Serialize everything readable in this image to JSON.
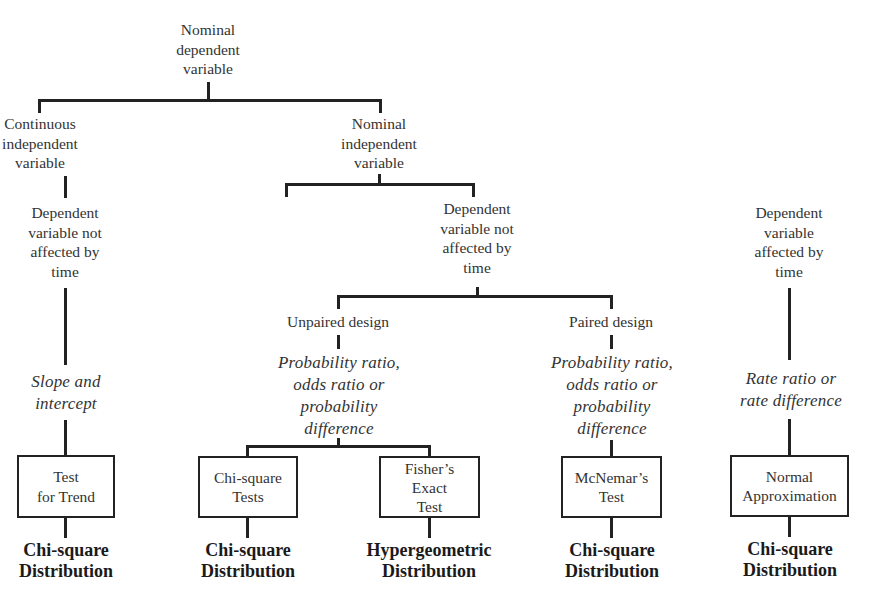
{
  "diagram": {
    "root": {
      "lines": [
        "Nominal",
        "dependent",
        "variable"
      ]
    },
    "left_branch": {
      "independent": {
        "lines": [
          "Continuous",
          "independent",
          "variable"
        ]
      },
      "dependent_time": {
        "lines": [
          "Dependent",
          "variable not",
          "affected by",
          "time"
        ]
      },
      "measure": {
        "lines": [
          "Slope and",
          "intercept"
        ]
      },
      "test": {
        "lines": [
          "Test",
          "for Trend"
        ]
      },
      "distribution": {
        "lines": [
          "Chi-square",
          "Distribution"
        ]
      }
    },
    "right_branch": {
      "independent": {
        "lines": [
          "Nominal",
          "independent",
          "variable"
        ]
      },
      "not_affected": {
        "label": {
          "lines": [
            "Dependent",
            "variable not",
            "affected by",
            "time"
          ]
        },
        "unpaired": {
          "design": "Unpaired design",
          "measure": {
            "lines": [
              "Probability ratio,",
              "odds ratio or",
              "probability",
              "difference"
            ]
          },
          "tests": [
            {
              "lines": [
                "Chi-square",
                "Tests"
              ],
              "distribution": [
                "Chi-square",
                "Distribution"
              ]
            },
            {
              "lines": [
                "Fisher’s",
                "Exact",
                "Test"
              ],
              "distribution": [
                "Hypergeometric",
                "Distribution"
              ]
            }
          ]
        },
        "paired": {
          "design": "Paired design",
          "measure": {
            "lines": [
              "Probability ratio,",
              "odds ratio or",
              "probability",
              "difference"
            ]
          },
          "test": {
            "lines": [
              "McNemar’s",
              "Test"
            ]
          },
          "distribution": {
            "lines": [
              "Chi-square",
              "Distribution"
            ]
          }
        }
      },
      "affected": {
        "label": {
          "lines": [
            "Dependent",
            "variable",
            "affected by",
            "time"
          ]
        },
        "measure": {
          "lines": [
            "Rate ratio or",
            "rate difference"
          ]
        },
        "test": {
          "lines": [
            "Normal",
            "Approximation"
          ]
        },
        "distribution": {
          "lines": [
            "Chi-square",
            "Distribution"
          ]
        }
      }
    }
  }
}
